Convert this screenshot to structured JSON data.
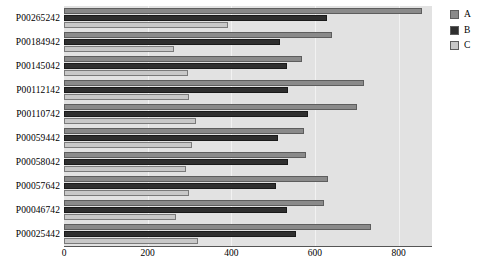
{
  "chart_data": {
    "type": "bar",
    "orientation": "horizontal",
    "title": "",
    "xlabel": "",
    "ylabel": "",
    "xlim": [
      0,
      880
    ],
    "grid": true,
    "legend_position": "right",
    "xticks": [
      0,
      200,
      400,
      600,
      800
    ],
    "xtick_labels": [
      "0",
      "200",
      "400",
      "600",
      "800"
    ],
    "categories": [
      "P00265242",
      "P00184942",
      "P00145042",
      "P00112142",
      "P00110742",
      "P00059442",
      "P00058042",
      "P00057642",
      "P00046742",
      "P00025442"
    ],
    "series": [
      {
        "name": "A",
        "color": "#8a8a8a",
        "values": [
          855,
          642,
          570,
          718,
          700,
          575,
          578,
          632,
          622,
          733
        ]
      },
      {
        "name": "B",
        "color": "#2f2f2f",
        "values": [
          630,
          517,
          533,
          536,
          584,
          512,
          536,
          507,
          533,
          555
        ]
      },
      {
        "name": "C",
        "color": "#c8c8c8",
        "values": [
          392,
          262,
          296,
          300,
          315,
          305,
          291,
          300,
          269,
          320
        ]
      }
    ]
  },
  "legend": {
    "items": [
      {
        "label": "A",
        "swatch": "legend-swatch-a"
      },
      {
        "label": "B",
        "swatch": "legend-swatch-b"
      },
      {
        "label": "C",
        "swatch": "legend-swatch-c"
      }
    ]
  }
}
